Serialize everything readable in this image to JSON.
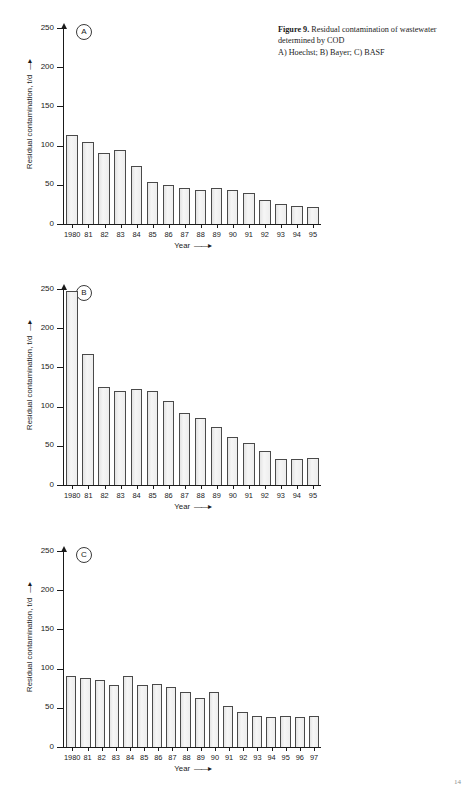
{
  "caption": {
    "lead": "Figure 9.",
    "text": " Residual contamination of wastewater determined by COD",
    "subtitle": "A) Hoechst; B) Bayer; C) BASF"
  },
  "page_number": "14",
  "axis": {
    "ylabel": "Residual contamination, t/d",
    "ylabel_arrow": "—▸",
    "xlabel": "Year",
    "xlabel_arrow": "——▸",
    "yticks": [
      0,
      50,
      100,
      150,
      200,
      250
    ],
    "ylim": [
      0,
      250
    ]
  },
  "colors": {
    "bar_fill": "#f0f0f0",
    "bar_stroke": "#4a4a4a",
    "axis": "#1a1a1a",
    "text": "#1a1a1a"
  },
  "chart_data": [
    {
      "id": "A",
      "type": "bar",
      "panel_letter": "A",
      "company": "Hoechst",
      "title": "Residual contamination of wastewater determined by COD",
      "xlabel": "Year",
      "ylabel": "Residual contamination, t/d",
      "ylim": [
        0,
        250
      ],
      "yticks": [
        0,
        50,
        100,
        150,
        200,
        250
      ],
      "grid": false,
      "legend": "none",
      "categories": [
        "1980",
        "81",
        "82",
        "83",
        "84",
        "85",
        "86",
        "87",
        "88",
        "89",
        "90",
        "91",
        "92",
        "93",
        "94",
        "95"
      ],
      "values": [
        113,
        104,
        90,
        95,
        74,
        54,
        50,
        46,
        44,
        46,
        43,
        39,
        30,
        25,
        23,
        22
      ]
    },
    {
      "id": "B",
      "type": "bar",
      "panel_letter": "B",
      "company": "Bayer",
      "title": "Residual contamination of wastewater determined by COD",
      "xlabel": "Year",
      "ylabel": "Residual contamination, t/d",
      "ylim": [
        0,
        250
      ],
      "yticks": [
        0,
        50,
        100,
        150,
        200,
        250
      ],
      "grid": false,
      "legend": "none",
      "categories": [
        "1980",
        "81",
        "82",
        "83",
        "84",
        "85",
        "86",
        "87",
        "88",
        "89",
        "90",
        "91",
        "92",
        "93",
        "94",
        "95"
      ],
      "values": [
        247,
        167,
        125,
        120,
        122,
        120,
        107,
        92,
        85,
        74,
        61,
        54,
        43,
        33,
        33,
        34
      ]
    },
    {
      "id": "C",
      "type": "bar",
      "panel_letter": "C",
      "company": "BASF",
      "title": "Residual contamination of wastewater determined by COD",
      "xlabel": "Year",
      "ylabel": "Residual contamination, t/d",
      "ylim": [
        0,
        250
      ],
      "yticks": [
        0,
        50,
        100,
        150,
        200,
        250
      ],
      "grid": false,
      "legend": "none",
      "categories": [
        "1980",
        "81",
        "82",
        "83",
        "84",
        "85",
        "86",
        "87",
        "88",
        "89",
        "90",
        "91",
        "92",
        "93",
        "94",
        "95",
        "96",
        "97"
      ],
      "values": [
        91,
        88,
        85,
        79,
        90,
        79,
        81,
        76,
        70,
        63,
        70,
        52,
        45,
        40,
        38,
        39,
        38,
        40
      ]
    }
  ]
}
